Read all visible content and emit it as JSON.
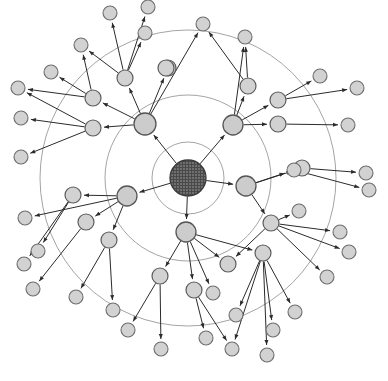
{
  "figure": {
    "type": "node-link-diagram",
    "width": 388,
    "height": 381,
    "background_color": "#ffffff",
    "center": {
      "x": 188,
      "y": 178
    }
  },
  "style": {
    "ring_stroke": "#9a9a9a",
    "edge_stroke": "#2b2b2b",
    "node_fill": "#d2d2d2",
    "node_stroke": "#6d6d6d",
    "center_fill_dark": "#4a4a4a",
    "center_fill_light": "#8e8e8e"
  },
  "rings": [
    {
      "name": "ring-inner",
      "radius": 36
    },
    {
      "name": "ring-middle",
      "radius": 83
    },
    {
      "name": "ring-outer",
      "radius": 148
    }
  ],
  "nodes": [
    {
      "id": "n0",
      "name": "center-hub",
      "level": 0,
      "x": 188,
      "y": 178,
      "r": 18
    },
    {
      "id": "h1",
      "name": "hub-upper-left",
      "level": 1,
      "x": 145,
      "y": 124,
      "r": 11
    },
    {
      "id": "h2",
      "name": "hub-upper-right",
      "level": 1,
      "x": 233,
      "y": 125,
      "r": 10
    },
    {
      "id": "h3",
      "name": "hub-lower-left",
      "level": 1,
      "x": 127,
      "y": 196,
      "r": 10
    },
    {
      "id": "h4",
      "name": "hub-lower-right",
      "level": 1,
      "x": 246,
      "y": 186,
      "r": 10
    },
    {
      "id": "h5",
      "name": "hub-bottom",
      "level": 1,
      "x": 186,
      "y": 232,
      "r": 10
    },
    {
      "id": "m1",
      "name": "mid-node-1",
      "level": 2,
      "x": 125,
      "y": 78,
      "r": 8
    },
    {
      "id": "m2",
      "name": "mid-node-2",
      "level": 2,
      "x": 168,
      "y": 68,
      "r": 8
    },
    {
      "id": "m3",
      "name": "mid-node-3",
      "level": 2,
      "x": 93,
      "y": 98,
      "r": 8
    },
    {
      "id": "m4",
      "name": "mid-node-4",
      "level": 2,
      "x": 93,
      "y": 128,
      "r": 8
    },
    {
      "id": "m5",
      "name": "mid-node-5",
      "level": 2,
      "x": 248,
      "y": 86,
      "r": 8
    },
    {
      "id": "m6",
      "name": "mid-node-6",
      "level": 2,
      "x": 278,
      "y": 100,
      "r": 8
    },
    {
      "id": "m7",
      "name": "mid-node-7",
      "level": 2,
      "x": 278,
      "y": 124,
      "r": 8
    },
    {
      "id": "m8",
      "name": "mid-node-8",
      "level": 2,
      "x": 302,
      "y": 168,
      "r": 8
    },
    {
      "id": "m9",
      "name": "mid-node-9",
      "level": 2,
      "x": 271,
      "y": 223,
      "r": 8
    },
    {
      "id": "m10",
      "name": "mid-node-10",
      "level": 2,
      "x": 263,
      "y": 253,
      "r": 8
    },
    {
      "id": "m11",
      "name": "mid-node-11",
      "level": 2,
      "x": 228,
      "y": 264,
      "r": 8
    },
    {
      "id": "m12",
      "name": "mid-node-12",
      "level": 2,
      "x": 194,
      "y": 290,
      "r": 8
    },
    {
      "id": "m13",
      "name": "mid-node-13",
      "level": 2,
      "x": 160,
      "y": 276,
      "r": 8
    },
    {
      "id": "m14",
      "name": "mid-node-14",
      "level": 2,
      "x": 109,
      "y": 240,
      "r": 8
    },
    {
      "id": "m15",
      "name": "mid-node-15",
      "level": 2,
      "x": 86,
      "y": 222,
      "r": 8
    },
    {
      "id": "m16",
      "name": "mid-node-16",
      "level": 2,
      "x": 73,
      "y": 195,
      "r": 8
    },
    {
      "id": "m17",
      "name": "mid-node-17",
      "level": 2,
      "x": 166,
      "y": 68,
      "r": 8
    },
    {
      "id": "l1",
      "name": "leaf-node-1",
      "level": 3,
      "x": 110,
      "y": 13,
      "r": 7
    },
    {
      "id": "l2",
      "name": "leaf-node-2",
      "level": 3,
      "x": 145,
      "y": 33,
      "r": 7
    },
    {
      "id": "l3",
      "name": "leaf-node-3",
      "level": 3,
      "x": 148,
      "y": 7,
      "r": 7
    },
    {
      "id": "l4",
      "name": "leaf-node-4",
      "level": 3,
      "x": 81,
      "y": 45,
      "r": 7
    },
    {
      "id": "l5",
      "name": "leaf-node-5",
      "level": 3,
      "x": 51,
      "y": 72,
      "r": 7
    },
    {
      "id": "l6",
      "name": "leaf-node-6",
      "level": 3,
      "x": 18,
      "y": 88,
      "r": 7
    },
    {
      "id": "l7",
      "name": "leaf-node-7",
      "level": 3,
      "x": 21,
      "y": 118,
      "r": 7
    },
    {
      "id": "l8",
      "name": "leaf-node-8",
      "level": 3,
      "x": 21,
      "y": 157,
      "r": 7
    },
    {
      "id": "l9",
      "name": "leaf-node-9",
      "level": 3,
      "x": 203,
      "y": 24,
      "r": 7
    },
    {
      "id": "l10",
      "name": "leaf-node-10",
      "level": 3,
      "x": 245,
      "y": 37,
      "r": 7
    },
    {
      "id": "l11",
      "name": "leaf-node-11",
      "level": 3,
      "x": 320,
      "y": 76,
      "r": 7
    },
    {
      "id": "l12",
      "name": "leaf-node-12",
      "level": 3,
      "x": 357,
      "y": 88,
      "r": 7
    },
    {
      "id": "l13",
      "name": "leaf-node-13",
      "level": 3,
      "x": 348,
      "y": 125,
      "r": 7
    },
    {
      "id": "l14",
      "name": "leaf-node-14",
      "level": 3,
      "x": 366,
      "y": 173,
      "r": 7
    },
    {
      "id": "l15",
      "name": "leaf-node-15",
      "level": 3,
      "x": 369,
      "y": 190,
      "r": 7
    },
    {
      "id": "l16",
      "name": "leaf-node-16",
      "level": 3,
      "x": 299,
      "y": 211,
      "r": 7
    },
    {
      "id": "l17",
      "name": "leaf-node-17",
      "level": 3,
      "x": 340,
      "y": 232,
      "r": 7
    },
    {
      "id": "l18",
      "name": "leaf-node-18",
      "level": 3,
      "x": 349,
      "y": 252,
      "r": 7
    },
    {
      "id": "l19",
      "name": "leaf-node-19",
      "level": 3,
      "x": 327,
      "y": 277,
      "r": 7
    },
    {
      "id": "l20",
      "name": "leaf-node-20",
      "level": 3,
      "x": 295,
      "y": 312,
      "r": 7
    },
    {
      "id": "l21",
      "name": "leaf-node-21",
      "level": 3,
      "x": 273,
      "y": 330,
      "r": 7
    },
    {
      "id": "l22",
      "name": "leaf-node-22",
      "level": 3,
      "x": 267,
      "y": 355,
      "r": 7
    },
    {
      "id": "l23",
      "name": "leaf-node-23",
      "level": 3,
      "x": 232,
      "y": 349,
      "r": 7
    },
    {
      "id": "l24",
      "name": "leaf-node-24",
      "level": 3,
      "x": 236,
      "y": 315,
      "r": 7
    },
    {
      "id": "l25",
      "name": "leaf-node-25",
      "level": 3,
      "x": 206,
      "y": 338,
      "r": 7
    },
    {
      "id": "l26",
      "name": "leaf-node-26",
      "level": 3,
      "x": 161,
      "y": 349,
      "r": 7
    },
    {
      "id": "l27",
      "name": "leaf-node-27",
      "level": 3,
      "x": 128,
      "y": 330,
      "r": 7
    },
    {
      "id": "l28",
      "name": "leaf-node-28",
      "level": 3,
      "x": 76,
      "y": 297,
      "r": 7
    },
    {
      "id": "l29",
      "name": "leaf-node-29",
      "level": 3,
      "x": 33,
      "y": 289,
      "r": 7
    },
    {
      "id": "l30",
      "name": "leaf-node-30",
      "level": 3,
      "x": 24,
      "y": 264,
      "r": 7
    },
    {
      "id": "l31",
      "name": "leaf-node-31",
      "level": 3,
      "x": 38,
      "y": 251,
      "r": 7
    },
    {
      "id": "l32",
      "name": "leaf-node-32",
      "level": 3,
      "x": 113,
      "y": 310,
      "r": 7
    },
    {
      "id": "l33",
      "name": "leaf-node-33",
      "level": 3,
      "x": 25,
      "y": 218,
      "r": 7
    },
    {
      "id": "l34",
      "name": "leaf-node-34",
      "level": 3,
      "x": 294,
      "y": 170,
      "r": 7
    },
    {
      "id": "l35",
      "name": "leaf-node-35",
      "level": 3,
      "x": 213,
      "y": 293,
      "r": 7
    }
  ],
  "edges": [
    {
      "from": "n0",
      "to": "h1",
      "name": "edge-center-to-hub-upper-left"
    },
    {
      "from": "n0",
      "to": "h2",
      "name": "edge-center-to-hub-upper-right"
    },
    {
      "from": "n0",
      "to": "h3",
      "name": "edge-center-to-hub-lower-left"
    },
    {
      "from": "n0",
      "to": "h4",
      "name": "edge-center-to-hub-lower-right"
    },
    {
      "from": "n0",
      "to": "h5",
      "name": "edge-center-to-hub-bottom"
    },
    {
      "from": "h1",
      "to": "m1",
      "name": "edge-hub1-m1"
    },
    {
      "from": "h1",
      "to": "m2",
      "name": "edge-hub1-m2"
    },
    {
      "from": "h1",
      "to": "m3",
      "name": "edge-hub1-m3"
    },
    {
      "from": "h1",
      "to": "m4",
      "name": "edge-hub1-m4"
    },
    {
      "from": "h1",
      "to": "l9",
      "name": "edge-hub1-l9"
    },
    {
      "from": "m1",
      "to": "l1",
      "name": "edge-m1-l1"
    },
    {
      "from": "m1",
      "to": "l2",
      "name": "edge-m1-l2"
    },
    {
      "from": "m1",
      "to": "l3",
      "name": "edge-m1-l3"
    },
    {
      "from": "m1",
      "to": "l4",
      "name": "edge-m1-l4"
    },
    {
      "from": "m3",
      "to": "l4",
      "name": "edge-m3-l4"
    },
    {
      "from": "m3",
      "to": "l5",
      "name": "edge-m3-l5"
    },
    {
      "from": "m3",
      "to": "l6",
      "name": "edge-m3-l6"
    },
    {
      "from": "m4",
      "to": "l7",
      "name": "edge-m4-l7"
    },
    {
      "from": "m4",
      "to": "l8",
      "name": "edge-m4-l8"
    },
    {
      "from": "m4",
      "to": "l6",
      "name": "edge-m4-l6"
    },
    {
      "from": "h2",
      "to": "m5",
      "name": "edge-hub2-m5"
    },
    {
      "from": "h2",
      "to": "m6",
      "name": "edge-hub2-m6"
    },
    {
      "from": "h2",
      "to": "m7",
      "name": "edge-hub2-m7"
    },
    {
      "from": "h2",
      "to": "l10",
      "name": "edge-hub2-l10"
    },
    {
      "from": "m5",
      "to": "l9",
      "name": "edge-m5-l9"
    },
    {
      "from": "m5",
      "to": "l10",
      "name": "edge-m5-l10"
    },
    {
      "from": "m6",
      "to": "l11",
      "name": "edge-m6-l11"
    },
    {
      "from": "m6",
      "to": "l12",
      "name": "edge-m6-l12"
    },
    {
      "from": "m7",
      "to": "l13",
      "name": "edge-m7-l13"
    },
    {
      "from": "h4",
      "to": "m8",
      "name": "edge-hub4-m8"
    },
    {
      "from": "h4",
      "to": "l34",
      "name": "edge-hub4-l34"
    },
    {
      "from": "h4",
      "to": "m9",
      "name": "edge-hub4-m9"
    },
    {
      "from": "m8",
      "to": "l14",
      "name": "edge-m8-l14"
    },
    {
      "from": "l34",
      "to": "l15",
      "name": "edge-l34-l15"
    },
    {
      "from": "m9",
      "to": "l16",
      "name": "edge-m9-l16"
    },
    {
      "from": "m9",
      "to": "l17",
      "name": "edge-m9-l17"
    },
    {
      "from": "m9",
      "to": "l18",
      "name": "edge-m9-l18"
    },
    {
      "from": "m9",
      "to": "l19",
      "name": "edge-m9-l19"
    },
    {
      "from": "m9",
      "to": "m11",
      "name": "edge-m9-m11"
    },
    {
      "from": "m10",
      "to": "l20",
      "name": "edge-m10-l20"
    },
    {
      "from": "m10",
      "to": "l21",
      "name": "edge-m10-l21"
    },
    {
      "from": "m10",
      "to": "l22",
      "name": "edge-m10-l22"
    },
    {
      "from": "m10",
      "to": "l24",
      "name": "edge-m10-l24"
    },
    {
      "from": "m10",
      "to": "l23",
      "name": "edge-m10-l23"
    },
    {
      "from": "h5",
      "to": "m11",
      "name": "edge-hub5-m11"
    },
    {
      "from": "h5",
      "to": "m12",
      "name": "edge-hub5-m12"
    },
    {
      "from": "h5",
      "to": "m13",
      "name": "edge-hub5-m13"
    },
    {
      "from": "h5",
      "to": "l35",
      "name": "edge-hub5-l35"
    },
    {
      "from": "h5",
      "to": "m10",
      "name": "edge-hub5-m10"
    },
    {
      "from": "m12",
      "to": "l25",
      "name": "edge-m12-l25"
    },
    {
      "from": "m12",
      "to": "l23",
      "name": "edge-m12-l23"
    },
    {
      "from": "m13",
      "to": "l26",
      "name": "edge-m13-l26"
    },
    {
      "from": "m13",
      "to": "l27",
      "name": "edge-m13-l27"
    },
    {
      "from": "h3",
      "to": "m14",
      "name": "edge-hub3-m14"
    },
    {
      "from": "h3",
      "to": "m15",
      "name": "edge-hub3-m15"
    },
    {
      "from": "h3",
      "to": "m16",
      "name": "edge-hub3-m16"
    },
    {
      "from": "h3",
      "to": "l33",
      "name": "edge-hub3-l33"
    },
    {
      "from": "m14",
      "to": "l28",
      "name": "edge-m14-l28"
    },
    {
      "from": "m14",
      "to": "l32",
      "name": "edge-m14-l32"
    },
    {
      "from": "m16",
      "to": "l30",
      "name": "edge-m16-l30"
    },
    {
      "from": "m16",
      "to": "l31",
      "name": "edge-m16-l31"
    },
    {
      "from": "m15",
      "to": "l29",
      "name": "edge-m15-l29"
    }
  ]
}
